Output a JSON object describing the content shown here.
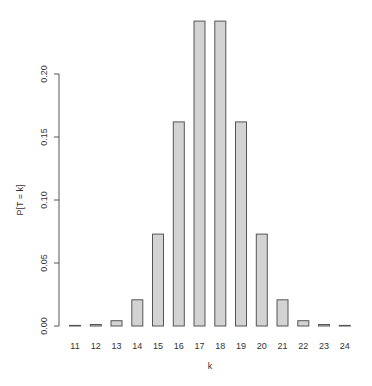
{
  "chart_data": {
    "type": "bar",
    "title": "",
    "xlabel": "k",
    "ylabel": "P[T = k]",
    "categories": [
      "11",
      "12",
      "13",
      "14",
      "15",
      "16",
      "17",
      "18",
      "19",
      "20",
      "21",
      "22",
      "23",
      "24"
    ],
    "values": [
      0.0002,
      0.0012,
      0.0042,
      0.0208,
      0.0729,
      0.162,
      0.242,
      0.242,
      0.162,
      0.0729,
      0.0208,
      0.0042,
      0.0012,
      0.0002
    ],
    "ylim": [
      0,
      0.242
    ],
    "yticks": [
      "0.00",
      "0.05",
      "0.10",
      "0.15",
      "0.20"
    ],
    "ytick_values": [
      0,
      0.05,
      0.1,
      0.15,
      0.2
    ],
    "grid": false,
    "legend": null,
    "colors": {
      "bar_fill": "#d3d3d3",
      "bar_stroke": "#555555",
      "axis": "#555555"
    }
  }
}
